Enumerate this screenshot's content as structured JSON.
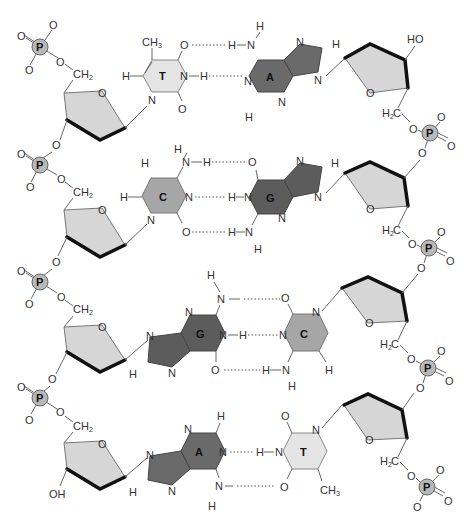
{
  "diagram": {
    "colors": {
      "thymine_fill": "#e4e4e4",
      "cytosine_fill": "#a6a6a6",
      "adenine_fill": "#6a6a6a",
      "guanine_fill": "#5c5c5c",
      "sugar_fill": "#d6d6d6",
      "phosphate_fill": "#b8b8b8"
    },
    "labels": {
      "phosphate": "P",
      "oxygen": "O",
      "nitrogen": "N",
      "hydrogen": "H",
      "ch2": "CH",
      "h2c": "H",
      "c": "C",
      "sub2": "2",
      "ch3": "CH",
      "sub3": "3",
      "ho": "HO",
      "oh": "OH"
    },
    "base_pairs": [
      {
        "left": "T",
        "right": "A",
        "left_name": "thymine",
        "right_name": "adenine",
        "h_bonds": 2
      },
      {
        "left": "C",
        "right": "G",
        "left_name": "cytosine",
        "right_name": "guanine",
        "h_bonds": 3
      },
      {
        "left": "G",
        "right": "C",
        "left_name": "guanine",
        "right_name": "cytosine",
        "h_bonds": 3
      },
      {
        "left": "A",
        "right": "T",
        "left_name": "adenine",
        "right_name": "thymine",
        "h_bonds": 2
      }
    ],
    "strand_ends": {
      "right_top": "HO",
      "left_bottom": "OH"
    }
  }
}
